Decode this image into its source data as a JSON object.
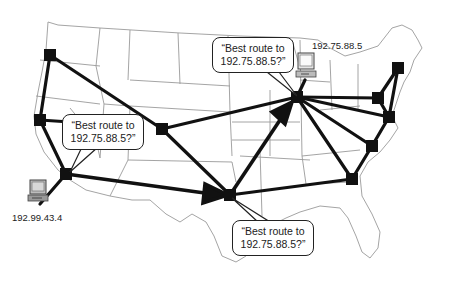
{
  "diagram": {
    "type": "network-routing-map",
    "background": "United States map outline",
    "colors": {
      "links": "#111111",
      "routers": "#111111",
      "state_borders": "#9a9a9a",
      "computer_screen": "#bdbdbd"
    },
    "hosts": [
      {
        "id": "source",
        "ip": "192.99.43.4",
        "icon": "desktop-computer-icon"
      },
      {
        "id": "destination",
        "ip": "192.75.88.5",
        "icon": "desktop-computer-icon"
      }
    ],
    "callouts": [
      {
        "id": "callout-west",
        "line1": "“Best route to",
        "line2": "192.75.88.5?”"
      },
      {
        "id": "callout-north",
        "line1": "“Best route to",
        "line2": "192.75.88.5?”"
      },
      {
        "id": "callout-south",
        "line1": "“Best route to",
        "line2": "192.75.88.5?”"
      }
    ],
    "routers": [
      {
        "id": "seattle",
        "x": 50,
        "y": 55
      },
      {
        "id": "sf",
        "x": 40,
        "y": 120
      },
      {
        "id": "la",
        "x": 66,
        "y": 174
      },
      {
        "id": "denver",
        "x": 162,
        "y": 129
      },
      {
        "id": "dallas",
        "x": 230,
        "y": 195
      },
      {
        "id": "chicago",
        "x": 297,
        "y": 97
      },
      {
        "id": "pittsburgh",
        "x": 378,
        "y": 98
      },
      {
        "id": "newyork",
        "x": 398,
        "y": 68
      },
      {
        "id": "dc",
        "x": 389,
        "y": 117
      },
      {
        "id": "raleigh",
        "x": 372,
        "y": 146
      },
      {
        "id": "atlanta",
        "x": 352,
        "y": 179
      }
    ],
    "links": [
      [
        "seattle",
        "sf"
      ],
      [
        "seattle",
        "denver"
      ],
      [
        "sf",
        "la"
      ],
      [
        "sf",
        "denver"
      ],
      [
        "denver",
        "chicago"
      ],
      [
        "denver",
        "dallas"
      ],
      [
        "dallas",
        "atlanta"
      ],
      [
        "chicago",
        "pittsburgh"
      ],
      [
        "chicago",
        "dc"
      ],
      [
        "chicago",
        "atlanta"
      ],
      [
        "pittsburgh",
        "newyork"
      ],
      [
        "pittsburgh",
        "dc"
      ],
      [
        "newyork",
        "dc"
      ],
      [
        "dc",
        "raleigh"
      ],
      [
        "raleigh",
        "atlanta"
      ],
      [
        "chicago",
        "raleigh"
      ]
    ],
    "route_arrows": [
      [
        "la",
        "dallas"
      ],
      [
        "dallas",
        "chicago"
      ]
    ]
  }
}
